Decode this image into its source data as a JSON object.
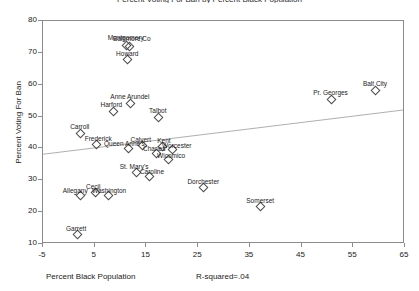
{
  "chart_data": {
    "type": "scatter",
    "title": "Percent Voting For Ban by Percent Black Population",
    "xlabel": "Percent Black Population",
    "ylabel": "Percent Voting For Ban",
    "annotation": "R-squared=.04",
    "xlim": [
      -5,
      65
    ],
    "ylim": [
      10,
      80
    ],
    "xticks": [
      -5,
      5,
      15,
      25,
      35,
      45,
      55,
      65
    ],
    "yticks": [
      10,
      20,
      30,
      40,
      50,
      60,
      70,
      80
    ],
    "grid": false,
    "legend": null,
    "marker": "open-diamond",
    "fit_line": {
      "label": "least-squares fit",
      "x0": -5,
      "y0": 37.8,
      "x1": 65,
      "y1": 51.8
    },
    "points": [
      {
        "label": "Montgomery",
        "x": 11.0,
        "y": 72.4
      },
      {
        "label": "Baltimore Co",
        "x": 11.6,
        "y": 72.0
      },
      {
        "label": "Howard",
        "x": 11.3,
        "y": 68.0
      },
      {
        "label": "Balt City",
        "x": 59.2,
        "y": 58.2
      },
      {
        "label": "Pr. Georges",
        "x": 50.6,
        "y": 55.6
      },
      {
        "label": "Anne Arundel",
        "x": 11.8,
        "y": 54.2
      },
      {
        "label": "Harford",
        "x": 8.6,
        "y": 51.8
      },
      {
        "label": "Talbot",
        "x": 17.2,
        "y": 49.9
      },
      {
        "label": "Carroll",
        "x": 2.1,
        "y": 44.9
      },
      {
        "label": "Frederick",
        "x": 5.3,
        "y": 41.4
      },
      {
        "label": "Calvert",
        "x": 14.1,
        "y": 41.1
      },
      {
        "label": "Kent",
        "x": 18.0,
        "y": 40.8
      },
      {
        "label": "Queen Anne's",
        "x": 11.5,
        "y": 40.2
      },
      {
        "label": "Worcester",
        "x": 19.9,
        "y": 39.9
      },
      {
        "label": "Charles",
        "x": 16.9,
        "y": 38.6
      },
      {
        "label": "Wicomico",
        "x": 19.2,
        "y": 36.6
      },
      {
        "label": "Dorchester",
        "x": 26.0,
        "y": 28.0
      },
      {
        "label": "St. Mary's",
        "x": 13.0,
        "y": 32.5
      },
      {
        "label": "Caroline",
        "x": 15.5,
        "y": 31.5
      },
      {
        "label": "Cecil",
        "x": 5.1,
        "y": 26.2
      },
      {
        "label": "Washington",
        "x": 7.6,
        "y": 25.3
      },
      {
        "label": "Allegany",
        "x": 2.2,
        "y": 25.4
      },
      {
        "label": "Somerset",
        "x": 37.0,
        "y": 21.8
      },
      {
        "label": "Garrett",
        "x": 1.6,
        "y": 13.1
      }
    ],
    "label_offsets": {
      "Montgomery": {
        "dx": 0,
        "dy": -11
      },
      "Baltimore Co": {
        "dx": 3,
        "dy": -11
      },
      "Howard": {
        "dx": 0,
        "dy": -9
      },
      "Balt City": {
        "dx": 0,
        "dy": -10
      },
      "Pr. Georges": {
        "dx": 0,
        "dy": -10
      },
      "Anne Arundel": {
        "dx": 0,
        "dy": -10
      },
      "Harford": {
        "dx": -2,
        "dy": -10
      },
      "Talbot": {
        "dx": 0,
        "dy": -10
      },
      "Carroll": {
        "dx": 0,
        "dy": -10
      },
      "Frederick": {
        "dx": 2,
        "dy": -9
      },
      "Calvert": {
        "dx": -1,
        "dy": -9
      },
      "Kent": {
        "dx": 2,
        "dy": -9
      },
      "Queen Anne's": {
        "dx": -4,
        "dy": -8
      },
      "Worcester": {
        "dx": 5,
        "dy": -7
      },
      "Charles": {
        "dx": -2,
        "dy": -8
      },
      "Wicomico": {
        "dx": 3,
        "dy": -7
      },
      "Dorchester": {
        "dx": 0,
        "dy": -9
      },
      "St. Mary's": {
        "dx": -2,
        "dy": -9
      },
      "Caroline": {
        "dx": 3,
        "dy": -8
      },
      "Cecil": {
        "dx": -2,
        "dy": -9
      },
      "Washington": {
        "dx": 1,
        "dy": -8
      },
      "Allegany": {
        "dx": -5,
        "dy": -8
      },
      "Somerset": {
        "dx": 0,
        "dy": -9
      },
      "Garrett": {
        "dx": -1,
        "dy": -9
      }
    },
    "colors": {
      "marker_stroke": "#4a4a4a",
      "axis": "#8c8c8c",
      "fit_line": "#9a9a9a",
      "text": "#1a1a1a",
      "background": "#ffffff"
    }
  }
}
